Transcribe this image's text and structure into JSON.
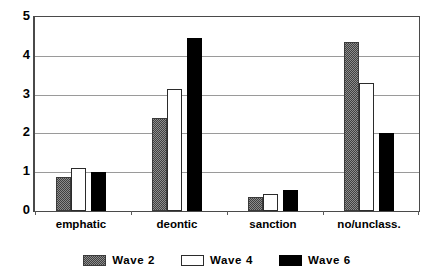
{
  "chart_data": {
    "type": "bar",
    "title": "",
    "subtitle": "",
    "xlabel": "",
    "ylabel": "",
    "categories": [
      "emphatic",
      "deontic",
      "sanction",
      "no/unclass."
    ],
    "series": [
      {
        "name": "Wave 2",
        "values": [
          0.88,
          2.4,
          0.35,
          4.35
        ],
        "color": "#8d8d8d",
        "pattern": "dotted-gray"
      },
      {
        "name": "Wave 4",
        "values": [
          1.1,
          3.15,
          0.45,
          3.3
        ],
        "color": "#ffffff",
        "pattern": "outline-white"
      },
      {
        "name": "Wave 6",
        "values": [
          1.0,
          4.45,
          0.55,
          2.0
        ],
        "color": "#000000",
        "pattern": "solid-black"
      }
    ],
    "ylim": [
      0,
      5
    ],
    "yticks": [
      0,
      1,
      2,
      3,
      4,
      5
    ],
    "ytick_labels": [
      "0",
      "1",
      "2",
      "3",
      "4",
      "5"
    ],
    "grid": true,
    "grid_axis": "y",
    "legend_position": "bottom-center",
    "legend_entries": [
      "Wave 2",
      "Wave 4",
      "Wave 6"
    ],
    "annotations": []
  }
}
